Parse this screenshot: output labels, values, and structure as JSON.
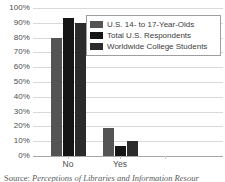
{
  "chart_data": {
    "type": "bar",
    "title": "",
    "subtitle": "",
    "xlabel": "",
    "ylabel": "",
    "categories": [
      "No",
      "Yes"
    ],
    "series": [
      {
        "name": "U.S. 14- to 17-Year-Olds",
        "values": [
          80,
          19
        ],
        "color": "#545454"
      },
      {
        "name": "Total U.S. Respondents",
        "values": [
          93,
          7
        ],
        "color": "#151515"
      },
      {
        "name": "Worldwide College Students",
        "values": [
          90,
          10
        ],
        "color": "#2b2b2b"
      }
    ],
    "ylim": [
      0,
      100
    ],
    "ytick_labels": [
      "0%",
      "10%",
      "20%",
      "30%",
      "40%",
      "50%",
      "60%",
      "70%",
      "80%",
      "90%",
      "100%"
    ],
    "ytick_values": [
      0,
      10,
      20,
      30,
      40,
      50,
      60,
      70,
      80,
      90,
      100
    ],
    "grid": true,
    "legend_position": "top-right",
    "value_suffix": "%"
  },
  "legend": {
    "items": [
      {
        "label": "U.S. 14- to 17-Year-Olds",
        "color": "#545454"
      },
      {
        "label": "Total U.S. Respondents",
        "color": "#151515"
      },
      {
        "label": "Worldwide College Students",
        "color": "#2b2b2b"
      }
    ]
  },
  "source": {
    "label": "Source:",
    "text": "Perceptions of Libraries and Information Resour"
  },
  "colors": {
    "gridline": "#d9d9d9",
    "axis": "#a6a6a6",
    "text": "#4d4d4d",
    "legend_border": "#9e9e9e",
    "background": "#ffffff"
  }
}
